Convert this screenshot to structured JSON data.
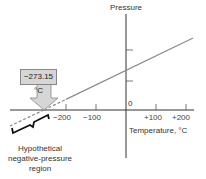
{
  "diagram": {
    "y_axis_label": "Pressure",
    "x_axis_label": "Temperature, °C",
    "origin_label": "0",
    "x_ticks": [
      {
        "value": -200,
        "label": "−200"
      },
      {
        "value": -100,
        "label": "−100"
      },
      {
        "value": 100,
        "label": "+100"
      },
      {
        "value": 200,
        "label": "+200"
      }
    ],
    "absolute_zero_callout": "−273.15 °C",
    "absolute_zero_value": -273.15,
    "region_caption_lines": [
      "Hypothetical",
      "negative-pressure",
      "region"
    ],
    "colors": {
      "axis": "#333333",
      "line": "#8a8a8a",
      "callout_fill": "#d6d6d6",
      "bracket": "#111111"
    }
  }
}
